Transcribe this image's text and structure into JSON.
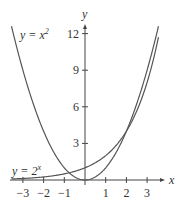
{
  "chart_data": {
    "type": "line",
    "title": "",
    "xlabel": "x",
    "ylabel": "y",
    "xlim": [
      -3.5,
      3.5
    ],
    "ylim": [
      0,
      12.5
    ],
    "x_ticks": [
      -3,
      -2,
      -1,
      1,
      2,
      3
    ],
    "x_tick_labels": [
      "−3",
      "−2",
      "−1",
      "1",
      "2",
      "3"
    ],
    "y_ticks": [
      3,
      6,
      9,
      12
    ],
    "y_tick_labels": [
      "3",
      "6",
      "9",
      "12"
    ],
    "grid": false,
    "series": [
      {
        "name": "y = x^2",
        "label_main": "y = x",
        "label_sup": "2",
        "x": [
          -3.5,
          -3,
          -2,
          -1,
          0,
          1,
          2,
          3,
          3.5
        ],
        "values": [
          12.25,
          9,
          4,
          1,
          0,
          1,
          4,
          9,
          12.25
        ]
      },
      {
        "name": "y = 2^x",
        "label_main": "y = 2",
        "label_sup": "x",
        "x": [
          -3.5,
          -3,
          -2,
          -1,
          0,
          1,
          2,
          3,
          3.5
        ],
        "values": [
          0.088,
          0.125,
          0.25,
          0.5,
          1,
          2,
          4,
          8,
          11.31
        ]
      }
    ],
    "annotations": [
      "y = x^2",
      "y = 2^x"
    ]
  }
}
